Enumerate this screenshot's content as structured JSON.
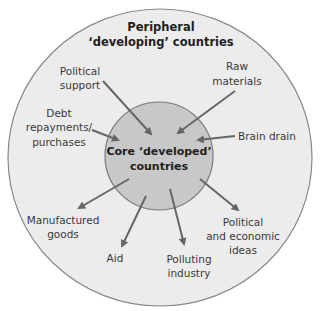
{
  "diagram": {
    "outer_title": [
      "Peripheral",
      "‘developing’ countries"
    ],
    "core_title": [
      "Core ‘developed’",
      "countries"
    ],
    "colors": {
      "outer_fill": "#ececec",
      "outer_stroke": "#8a8a8a",
      "inner_fill": "#c8c8c8",
      "inner_stroke": "#7a7a7a",
      "arrow": "#666666"
    },
    "inflows": [
      {
        "label": [
          "Political",
          "support"
        ]
      },
      {
        "label": [
          "Raw",
          "materials"
        ]
      },
      {
        "label": [
          "Debt",
          "repayments/",
          "purchases"
        ]
      },
      {
        "label": [
          "Brain drain"
        ]
      }
    ],
    "outflows": [
      {
        "label": [
          "Manufactured",
          "goods"
        ]
      },
      {
        "label": [
          "Aid"
        ]
      },
      {
        "label": [
          "Polluting",
          "industry"
        ]
      },
      {
        "label": [
          "Political",
          "and economic",
          "ideas"
        ]
      }
    ]
  }
}
